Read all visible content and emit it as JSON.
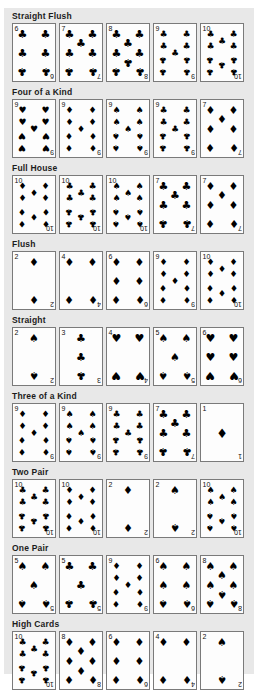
{
  "suit_glyphs": {
    "spades": "♠",
    "hearts": "♥",
    "diamonds": "♦",
    "clubs": "♣"
  },
  "sections": [
    {
      "label": "Straight Flush",
      "cards": [
        {
          "rank": "6",
          "suit": "clubs"
        },
        {
          "rank": "7",
          "suit": "clubs"
        },
        {
          "rank": "8",
          "suit": "clubs"
        },
        {
          "rank": "9",
          "suit": "clubs"
        },
        {
          "rank": "10",
          "suit": "clubs"
        }
      ]
    },
    {
      "label": "Four of a Kind",
      "cards": [
        {
          "rank": "9",
          "suit": "hearts"
        },
        {
          "rank": "9",
          "suit": "diamonds"
        },
        {
          "rank": "9",
          "suit": "spades"
        },
        {
          "rank": "9",
          "suit": "clubs"
        },
        {
          "rank": "7",
          "suit": "diamonds"
        }
      ]
    },
    {
      "label": "Full House",
      "cards": [
        {
          "rank": "10",
          "suit": "diamonds"
        },
        {
          "rank": "10",
          "suit": "clubs"
        },
        {
          "rank": "10",
          "suit": "spades"
        },
        {
          "rank": "7",
          "suit": "clubs"
        },
        {
          "rank": "7",
          "suit": "diamonds"
        }
      ]
    },
    {
      "label": "Flush",
      "cards": [
        {
          "rank": "2",
          "suit": "diamonds"
        },
        {
          "rank": "4",
          "suit": "diamonds"
        },
        {
          "rank": "6",
          "suit": "diamonds"
        },
        {
          "rank": "9",
          "suit": "diamonds"
        },
        {
          "rank": "10",
          "suit": "diamonds"
        }
      ]
    },
    {
      "label": "Straight",
      "cards": [
        {
          "rank": "2",
          "suit": "spades"
        },
        {
          "rank": "3",
          "suit": "clubs"
        },
        {
          "rank": "4",
          "suit": "hearts"
        },
        {
          "rank": "5",
          "suit": "spades"
        },
        {
          "rank": "6",
          "suit": "hearts"
        }
      ]
    },
    {
      "label": "Three of a Kind",
      "cards": [
        {
          "rank": "9",
          "suit": "diamonds"
        },
        {
          "rank": "9",
          "suit": "spades"
        },
        {
          "rank": "9",
          "suit": "clubs"
        },
        {
          "rank": "7",
          "suit": "clubs"
        },
        {
          "rank": "1",
          "suit": "diamonds"
        }
      ]
    },
    {
      "label": "Two Pair",
      "cards": [
        {
          "rank": "10",
          "suit": "clubs"
        },
        {
          "rank": "10",
          "suit": "diamonds"
        },
        {
          "rank": "2",
          "suit": "diamonds"
        },
        {
          "rank": "2",
          "suit": "spades"
        },
        {
          "rank": "10",
          "suit": "spades"
        }
      ]
    },
    {
      "label": "One Pair",
      "cards": [
        {
          "rank": "5",
          "suit": "spades"
        },
        {
          "rank": "5",
          "suit": "clubs"
        },
        {
          "rank": "9",
          "suit": "diamonds"
        },
        {
          "rank": "6",
          "suit": "spades"
        },
        {
          "rank": "8",
          "suit": "spades"
        }
      ]
    },
    {
      "label": "High Cards",
      "cards": [
        {
          "rank": "10",
          "suit": "clubs"
        },
        {
          "rank": "8",
          "suit": "diamonds"
        },
        {
          "rank": "6",
          "suit": "diamonds"
        },
        {
          "rank": "4",
          "suit": "diamonds"
        },
        {
          "rank": "2",
          "suit": "spades"
        }
      ]
    }
  ]
}
